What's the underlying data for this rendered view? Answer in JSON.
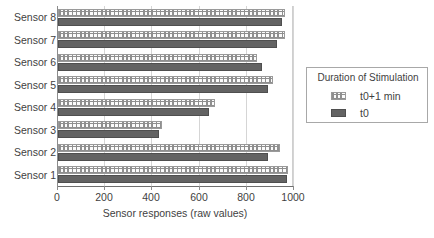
{
  "chart_data": {
    "type": "bar",
    "orientation": "horizontal",
    "title": "",
    "xlabel": "Sensor responses (raw values)",
    "ylabel": "",
    "xlim": [
      0,
      1000
    ],
    "xticks": [
      0,
      200,
      400,
      600,
      800,
      1000
    ],
    "xtick_labels": [
      "0",
      "200",
      "400",
      "600",
      "800",
      "1000"
    ],
    "grid": true,
    "categories": [
      "Sensor 1",
      "Sensor 2",
      "Sensor 3",
      "Sensor 4",
      "Sensor 5",
      "Sensor 6",
      "Sensor 7",
      "Sensor 8"
    ],
    "legend_title": "Duration of Stimulation",
    "legend_position": "right",
    "series": [
      {
        "name": "t0+1 min",
        "pattern": "dotted",
        "color": "#fbfbfb",
        "values": [
          975,
          940,
          440,
          665,
          910,
          845,
          960,
          960
        ]
      },
      {
        "name": "t0",
        "pattern": "solid",
        "color": "#636363",
        "values": [
          970,
          890,
          430,
          640,
          890,
          865,
          930,
          950
        ]
      }
    ]
  },
  "axis": {
    "x_title": "Sensor responses (raw values)"
  },
  "legend": {
    "title": "Duration of Stimulation",
    "entries": [
      {
        "label": "t0+1 min"
      },
      {
        "label": "t0"
      }
    ]
  }
}
